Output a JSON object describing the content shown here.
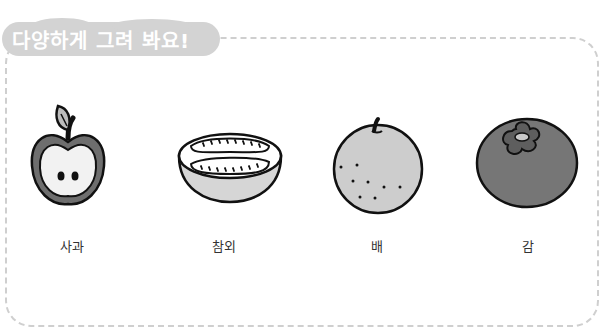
{
  "title": "다양하게 그려 봐요!",
  "fruits": [
    {
      "name": "apple",
      "label": "사과"
    },
    {
      "name": "melon",
      "label": "참외"
    },
    {
      "name": "pear",
      "label": "배"
    },
    {
      "name": "persimmon",
      "label": "감"
    }
  ],
  "colors": {
    "badge": "#d3d3d3",
    "border": "#cfcfcf",
    "dark_gray": "#6e6e6e",
    "light_gray": "#c8c8c8",
    "outline": "#111111"
  }
}
